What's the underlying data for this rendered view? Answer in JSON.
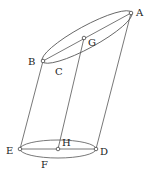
{
  "diagram": {
    "type": "geometry-oblique-cylinder",
    "points": {
      "A": {
        "label": "A",
        "x": 131,
        "y": 13
      },
      "B": {
        "label": "B",
        "x": 43,
        "y": 61
      },
      "G": {
        "label": "G",
        "x": 84,
        "y": 38
      },
      "E": {
        "label": "E",
        "x": 20,
        "y": 149
      },
      "H": {
        "label": "H",
        "x": 58,
        "y": 149
      },
      "D": {
        "label": "D",
        "x": 96,
        "y": 149
      }
    },
    "labels": {
      "A": "A",
      "B": "B",
      "C": "C",
      "D": "D",
      "E": "E",
      "F": "F",
      "G": "G",
      "H": "H"
    },
    "segments": [
      [
        "B",
        "A"
      ],
      [
        "E",
        "D"
      ],
      [
        "B",
        "E"
      ],
      [
        "G",
        "H"
      ],
      [
        "A",
        "D"
      ]
    ],
    "ellipses": [
      {
        "name": "top-base",
        "through": [
          "B",
          "A"
        ],
        "center": "G"
      },
      {
        "name": "bottom-base",
        "through": [
          "E",
          "D"
        ],
        "center": "H"
      }
    ]
  }
}
